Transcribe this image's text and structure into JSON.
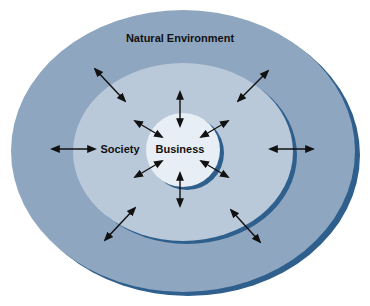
{
  "diagram": {
    "type": "nested-ellipses",
    "colors": {
      "background": "#ffffff",
      "outer_fill": "#8fa6c0",
      "outer_shadow": "#2f5f8c",
      "middle_fill": "#b9c9da",
      "middle_shadow": "#2f5f8c",
      "inner_fill": "#e8eef5",
      "inner_shadow": "#2f5f8c",
      "arrow": "#111111",
      "text": "#111111"
    },
    "layers": [
      {
        "id": "outer",
        "label": "Natural Environment"
      },
      {
        "id": "middle",
        "label": "Society"
      },
      {
        "id": "inner",
        "label": "Business"
      }
    ],
    "arrows": [
      {
        "from": [
          95,
          69
        ],
        "to": [
          125,
          101
        ],
        "bidirectional": true
      },
      {
        "from": [
          268,
          71
        ],
        "to": [
          238,
          101
        ],
        "bidirectional": true
      },
      {
        "from": [
          180,
          92
        ],
        "to": [
          180,
          126
        ],
        "bidirectional": true
      },
      {
        "from": [
          135,
          121
        ],
        "to": [
          162,
          137
        ],
        "bidirectional": true
      },
      {
        "from": [
          228,
          121
        ],
        "to": [
          201,
          137
        ],
        "bidirectional": true
      },
      {
        "from": [
          52,
          149
        ],
        "to": [
          95,
          149
        ],
        "bidirectional": true
      },
      {
        "from": [
          270,
          149
        ],
        "to": [
          313,
          149
        ],
        "bidirectional": true
      },
      {
        "from": [
          135,
          177
        ],
        "to": [
          162,
          161
        ],
        "bidirectional": true
      },
      {
        "from": [
          228,
          177
        ],
        "to": [
          201,
          161
        ],
        "bidirectional": true
      },
      {
        "from": [
          180,
          173
        ],
        "to": [
          180,
          206
        ],
        "bidirectional": true
      },
      {
        "from": [
          105,
          240
        ],
        "to": [
          135,
          208
        ],
        "bidirectional": true
      },
      {
        "from": [
          260,
          242
        ],
        "to": [
          231,
          210
        ],
        "bidirectional": true
      }
    ]
  }
}
